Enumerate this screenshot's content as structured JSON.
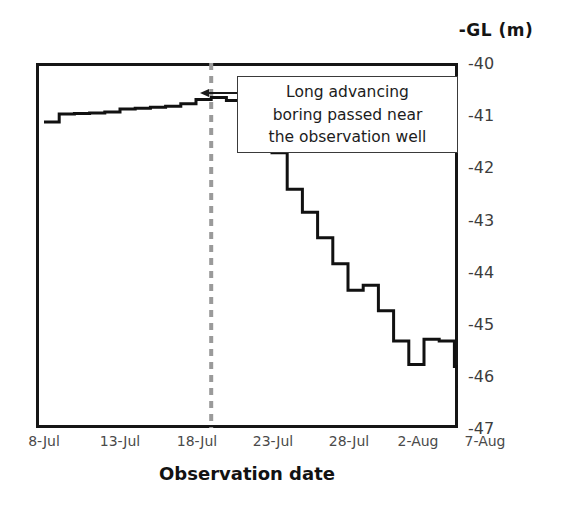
{
  "chart_data": {
    "type": "line",
    "title": "",
    "subtitle": "",
    "xlabel": "Observation date",
    "ylabel": "-GL (m)",
    "ylabel_position": "top-right",
    "grid": false,
    "legend": null,
    "legend_position": "none",
    "line_style": "step-post",
    "line_color": "#111111",
    "xlim_labels": [
      "8-Jul",
      "8-Aug"
    ],
    "ylim": [
      -47,
      -40
    ],
    "yticks": [
      "-40",
      "-41",
      "-42",
      "-43",
      "-44",
      "-45",
      "-46",
      "-47"
    ],
    "ytick_values": [
      -40,
      -41,
      -42,
      -43,
      -44,
      -45,
      -46,
      -47
    ],
    "xticks": [
      "8-Jul",
      "13-Jul",
      "18-Jul",
      "23-Jul",
      "28-Jul",
      "2-Aug",
      "7-Aug"
    ],
    "xtick_day_offsets": [
      0,
      5,
      10,
      15,
      20,
      25,
      30
    ],
    "series": [
      {
        "name": "Groundwater level",
        "x_days_from_8jul": [
          0,
          1,
          2,
          3,
          4,
          5,
          6,
          7,
          8,
          9,
          10,
          11,
          12,
          13,
          14,
          15,
          16,
          17,
          18,
          19,
          20,
          21,
          22,
          23,
          24,
          25,
          26,
          27,
          28,
          29,
          30,
          31
        ],
        "values": [
          -41.13,
          -40.98,
          -40.97,
          -40.96,
          -40.94,
          -40.88,
          -40.87,
          -40.85,
          -40.83,
          -40.78,
          -40.7,
          -40.66,
          -40.72,
          -41.0,
          -41.25,
          -41.72,
          -42.42,
          -42.86,
          -43.35,
          -43.85,
          -44.36,
          -44.26,
          -44.75,
          -45.33,
          -45.78,
          -45.3,
          -45.33,
          -45.82,
          -46.2,
          -46.48,
          -46.82,
          -47.0
        ]
      }
    ],
    "vertical_marker": {
      "label": "",
      "x_day": 11,
      "x_date": "19-Jul",
      "style": "dashed",
      "color": "#9a9a9a"
    },
    "annotations": [
      {
        "name": "boring-callout",
        "lines": [
          "Long advancing",
          "boring passed near",
          "the observation well"
        ],
        "arrow_points_to": "vertical-marker"
      }
    ]
  },
  "axis": {
    "y_axis_title": "-GL (m)",
    "x_axis_title": "Observation date"
  }
}
